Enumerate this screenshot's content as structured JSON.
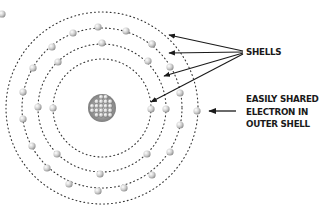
{
  "diagram": {
    "center": [
      102,
      108
    ],
    "nucleus": {
      "radius": 14,
      "color": "#8a8a8a"
    },
    "shells": [
      {
        "radius": 49
      },
      {
        "radius": 64
      },
      {
        "radius": 80
      },
      {
        "radius": 96
      }
    ],
    "shell_color": "#333333",
    "electron_color": "#bdbdbd",
    "electrons": [
      [
        102,
        43
      ],
      [
        152,
        44
      ],
      [
        148,
        61
      ],
      [
        58,
        62
      ],
      [
        53,
        108
      ],
      [
        151,
        109
      ],
      [
        147,
        154
      ],
      [
        57,
        154
      ],
      [
        100,
        174
      ],
      [
        152,
        175
      ],
      [
        47,
        168
      ],
      [
        73,
        33
      ],
      [
        126,
        31
      ],
      [
        52,
        47
      ],
      [
        170,
        67
      ],
      [
        38,
        107
      ],
      [
        166,
        109
      ],
      [
        170,
        152
      ],
      [
        32,
        146
      ],
      [
        69,
        184
      ],
      [
        124,
        188
      ],
      [
        98,
        27
      ],
      [
        152,
        44
      ],
      [
        33,
        68
      ],
      [
        180,
        93
      ],
      [
        23,
        92
      ],
      [
        180,
        125
      ],
      [
        23,
        119
      ],
      [
        98,
        191
      ],
      [
        197,
        111
      ]
    ],
    "partial_electron": [
      2,
      14
    ],
    "arrow_color": "#1a1a1a",
    "shell_arrows": [
      {
        "from": [
          243,
          51
        ],
        "to": [
          169,
          35
        ]
      },
      {
        "from": [
          243,
          52
        ],
        "to": [
          169,
          53
        ]
      },
      {
        "from": [
          243,
          53
        ],
        "to": [
          164,
          76
        ]
      },
      {
        "from": [
          243,
          54
        ],
        "to": [
          151,
          102
        ]
      }
    ],
    "electron_arrow": {
      "from": [
        236,
        111
      ],
      "to": [
        209,
        111
      ]
    }
  },
  "labels": {
    "shells": "SHELLS",
    "electron_lines": [
      "EASILY SHARED",
      "ELECTRON IN",
      "OUTER SHELL"
    ]
  }
}
